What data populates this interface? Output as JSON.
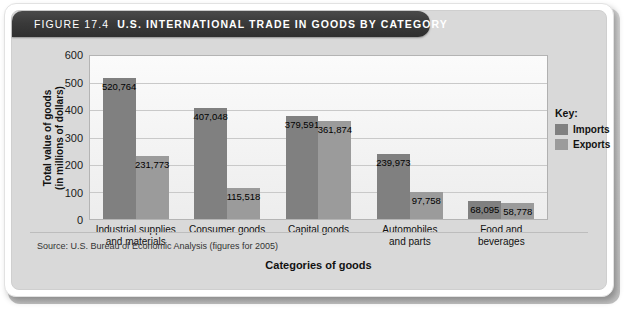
{
  "figure": {
    "number_label": "FIGURE 17.4",
    "title": "U.S. INTERNATIONAL TRADE IN GOODS BY CATEGORY",
    "source": "Source: U.S. Bureau of Economic Analysis (figures for 2005)"
  },
  "legend": {
    "title": "Key:",
    "items": [
      {
        "label": "Imports",
        "color": "#808080"
      },
      {
        "label": "Exports",
        "color": "#9b9b9b"
      }
    ]
  },
  "axes": {
    "y_label_line1": "Total value of goods",
    "y_label_line2": "(in millions of dollars)",
    "x_label": "Categories of goods",
    "y_ticks": [
      "0",
      "100",
      "200",
      "300",
      "400",
      "500",
      "600"
    ]
  },
  "chart_data": {
    "type": "bar",
    "title": "U.S. INTERNATIONAL TRADE IN GOODS BY CATEGORY",
    "xlabel": "Categories of goods",
    "ylabel": "Total value of goods (in millions of dollars)",
    "ylim": [
      0,
      600
    ],
    "ytick_step": 100,
    "grid": true,
    "legend_position": "right",
    "categories": [
      "Industrial supplies and materials",
      "Consumer goods",
      "Capital goods",
      "Automobiles and parts",
      "Food and beverages"
    ],
    "category_lines": [
      [
        "Industrial supplies",
        "and materials"
      ],
      [
        "Consumer goods",
        ""
      ],
      [
        "Capital goods",
        ""
      ],
      [
        "Automobiles",
        "and parts"
      ],
      [
        "Food and",
        "beverages"
      ]
    ],
    "units": "millions of dollars",
    "series": [
      {
        "name": "Imports",
        "color": "#808080",
        "values": [
          520764,
          407048,
          379591,
          239973,
          68095
        ],
        "labels": [
          "520,764",
          "407,048",
          "379,591",
          "239,973",
          "68,095"
        ]
      },
      {
        "name": "Exports",
        "color": "#9b9b9b",
        "values": [
          231773,
          115518,
          361874,
          97758,
          58778
        ],
        "labels": [
          "231,773",
          "115,518",
          "361,874",
          "97,758",
          "58,778"
        ]
      }
    ]
  }
}
